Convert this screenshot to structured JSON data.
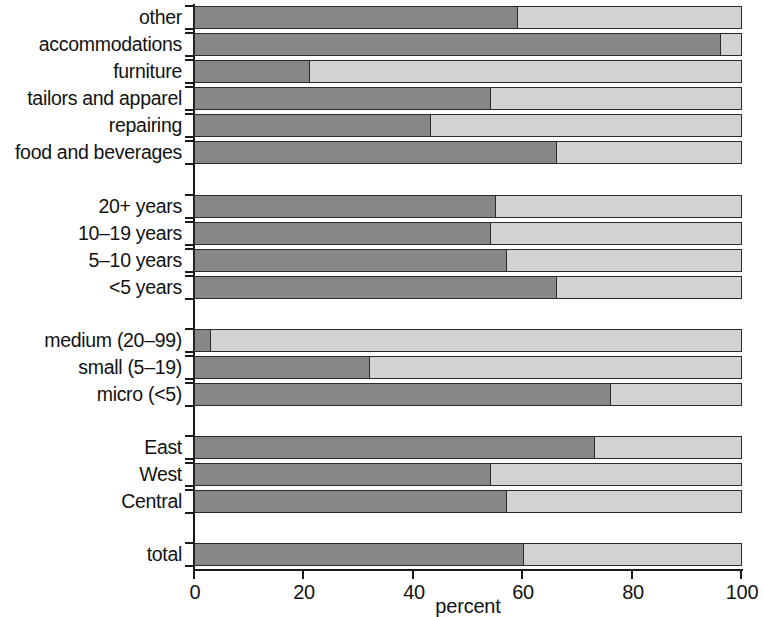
{
  "chart_data": {
    "type": "bar",
    "orientation": "horizontal",
    "stacked": true,
    "title": "",
    "xlabel": "percent",
    "ylabel": "",
    "xlim": [
      0,
      100
    ],
    "xticks": [
      0,
      20,
      40,
      60,
      80,
      100
    ],
    "xtick_labels": [
      "0",
      "20",
      "40",
      "60",
      "80",
      "100"
    ],
    "grid": false,
    "legend": "none",
    "series": [
      {
        "name": "dark",
        "color": "#878787"
      },
      {
        "name": "light",
        "color": "#d2d2d2"
      }
    ],
    "groups": [
      {
        "name": "sector",
        "categories": [
          "other",
          "accommodations",
          "furniture",
          "tailors and apparel",
          "repairing",
          "food and beverages"
        ],
        "dark_values": [
          59,
          96,
          21,
          54,
          43,
          66
        ],
        "light_values": [
          41,
          4,
          79,
          46,
          57,
          34
        ]
      },
      {
        "name": "age",
        "categories": [
          "20+ years",
          "10-19 years",
          "5-10 years",
          "<5 years"
        ],
        "dark_values": [
          55,
          54,
          57,
          66
        ],
        "light_values": [
          45,
          46,
          43,
          34
        ]
      },
      {
        "name": "size",
        "categories": [
          "medium (20-99)",
          "small (5-19)",
          "micro (<5)"
        ],
        "dark_values": [
          3,
          32,
          76
        ],
        "light_values": [
          97,
          68,
          24
        ]
      },
      {
        "name": "region",
        "categories": [
          "East",
          "West",
          "Central"
        ],
        "dark_values": [
          73,
          54,
          57
        ],
        "light_values": [
          27,
          46,
          43
        ]
      },
      {
        "name": "total",
        "categories": [
          "total"
        ],
        "dark_values": [
          60
        ],
        "light_values": [
          40
        ]
      }
    ],
    "all_categories": [
      "other",
      "accommodations",
      "furniture",
      "tailors and apparel",
      "repairing",
      "food and beverages",
      "20+ years",
      "10-19 years",
      "5-10 years",
      "<5 years",
      "medium (20-99)",
      "small (5-19)",
      "micro (<5)",
      "East",
      "West",
      "Central",
      "total"
    ],
    "all_dark_values": [
      59,
      96,
      21,
      54,
      43,
      66,
      55,
      54,
      57,
      66,
      3,
      32,
      76,
      73,
      54,
      57,
      60
    ]
  },
  "rows": [
    {
      "label": "other",
      "dark": 59,
      "top": 6
    },
    {
      "label": "accommodations",
      "dark": 96,
      "top": 33
    },
    {
      "label": "furniture",
      "dark": 21,
      "top": 60
    },
    {
      "label": "tailors and apparel",
      "dark": 54,
      "top": 87
    },
    {
      "label": "repairing",
      "dark": 43,
      "top": 114
    },
    {
      "label": "food and beverages",
      "dark": 66,
      "top": 141
    },
    {
      "label": "20+ years",
      "dark": 55,
      "top": 195
    },
    {
      "label": "10–19 years",
      "dark": 54,
      "top": 222
    },
    {
      "label": "5–10 years",
      "dark": 57,
      "top": 249
    },
    {
      "label": "<5 years",
      "dark": 66,
      "top": 276
    },
    {
      "label": "medium (20–99)",
      "dark": 3,
      "top": 329
    },
    {
      "label": "small (5–19)",
      "dark": 32,
      "top": 356
    },
    {
      "label": "micro (<5)",
      "dark": 76,
      "top": 383
    },
    {
      "label": "East",
      "dark": 73,
      "top": 436
    },
    {
      "label": "West",
      "dark": 54,
      "top": 463
    },
    {
      "label": "Central",
      "dark": 57,
      "top": 490
    },
    {
      "label": "total",
      "dark": 60,
      "top": 543
    }
  ],
  "axis": {
    "title": "percent",
    "ticks": [
      {
        "value": "0",
        "pos": 194
      },
      {
        "value": "20",
        "pos": 303
      },
      {
        "value": "40",
        "pos": 413
      },
      {
        "value": "60",
        "pos": 522
      },
      {
        "value": "80",
        "pos": 632
      },
      {
        "value": "100",
        "pos": 741
      }
    ]
  },
  "colors": {
    "dark_segment": "#878787",
    "light_segment": "#d2d2d2",
    "outline": "#2b2b2b",
    "axis": "#1a1a1a",
    "text": "#121212",
    "background": "#ffffff"
  }
}
